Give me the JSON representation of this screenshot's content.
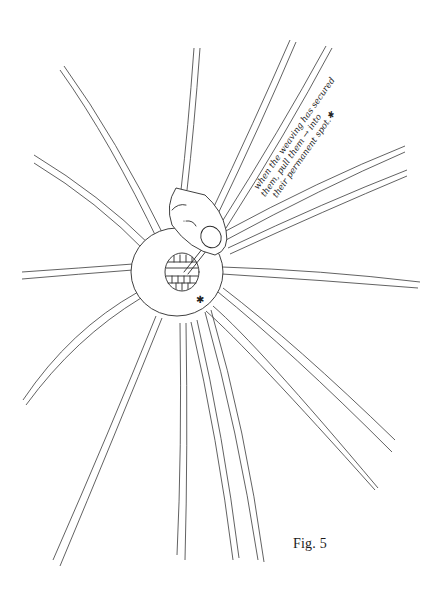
{
  "figure": {
    "caption": "Fig. 5",
    "annotation": {
      "line1": "when the weaving has secured",
      "line2": "them, pull them → into",
      "line3": "their permanent spot.✱"
    },
    "asterisk_mark": "✱",
    "colors": {
      "ink": "#2a2a2a",
      "paper": "#ffffff"
    }
  }
}
